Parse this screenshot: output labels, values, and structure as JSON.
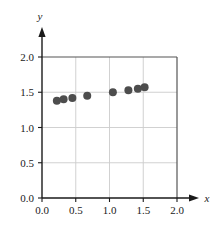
{
  "chart_data": {
    "type": "scatter",
    "title": "",
    "subtitle": "",
    "xlabel": "x",
    "ylabel": "y",
    "xlim": [
      0.0,
      2.0
    ],
    "ylim": [
      0.0,
      2.0
    ],
    "grid": true,
    "legend": null,
    "xticks": [
      "0.0",
      "0.5",
      "1.0",
      "1.5",
      "2.0"
    ],
    "xtick_values": [
      0.0,
      0.5,
      1.0,
      1.5,
      2.0
    ],
    "yticks": [
      "0.0",
      "0.5",
      "1.0",
      "1.5",
      "2.0"
    ],
    "ytick_values": [
      0.0,
      0.5,
      1.0,
      1.5,
      2.0
    ],
    "x": [
      0.22,
      0.32,
      0.45,
      0.67,
      1.05,
      1.28,
      1.42,
      1.52
    ],
    "y": [
      1.38,
      1.4,
      1.42,
      1.45,
      1.5,
      1.53,
      1.55,
      1.57
    ],
    "points": [
      {
        "x": 0.22,
        "y": 1.38
      },
      {
        "x": 0.32,
        "y": 1.4
      },
      {
        "x": 0.45,
        "y": 1.42
      },
      {
        "x": 0.67,
        "y": 1.45
      },
      {
        "x": 1.05,
        "y": 1.5
      },
      {
        "x": 1.28,
        "y": 1.53
      },
      {
        "x": 1.42,
        "y": 1.55
      },
      {
        "x": 1.52,
        "y": 1.57
      }
    ],
    "marker": "circle",
    "marker_size": 4,
    "colors": {
      "marker": "#4d4d4d",
      "axis": "#1a1a1a",
      "grid": "#cccccc",
      "frame": "#555555",
      "background": "#ffffff"
    }
  },
  "axes": {
    "x_axis_label": "x",
    "y_axis_label": "y"
  }
}
